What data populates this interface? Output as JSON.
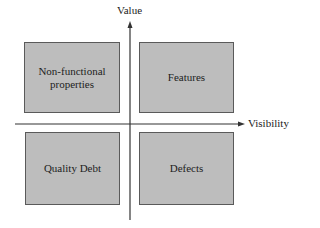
{
  "diagram": {
    "type": "quadrant",
    "axes": {
      "y_label": "Value",
      "x_label": "Visibility"
    },
    "quadrants": {
      "top_left": "Non-functional properties",
      "top_right": "Features",
      "bottom_left": "Quality Debt",
      "bottom_right": "Defects"
    },
    "colors": {
      "box_fill": "#bdbdbd",
      "box_border": "#5a5a5a",
      "axis": "#333333"
    }
  }
}
